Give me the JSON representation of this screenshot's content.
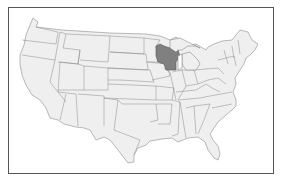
{
  "map": {
    "type": "US states outline map",
    "highlighted_state": "Wisconsin",
    "colors": {
      "highlight": "#808080",
      "state_fill": "#efefef",
      "border": "#777777",
      "frame": "#555555",
      "background": "#ffffff"
    }
  }
}
